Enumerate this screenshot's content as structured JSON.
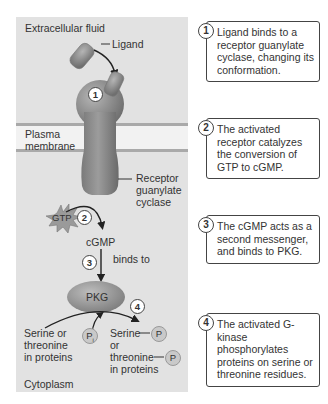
{
  "diagram": {
    "regions": {
      "extracellular": "Extracellular fluid",
      "membrane": "Plasma\nmembrane",
      "cytoplasm": "Cytoplasm"
    },
    "labels": {
      "ligand": "Ligand",
      "receptor": "Receptor\nguanylate\ncyclase",
      "gtp": "GTP",
      "cgmp": "cGMP",
      "binds_to": "binds to",
      "pkg": "PKG",
      "substrate": "Serine or\nthreonine\nin proteins",
      "pi": "P",
      "pi_sub": "i",
      "product_serine": "Serine",
      "product_or": "or",
      "product_threonine": "threonine",
      "product_in_proteins": "in proteins",
      "phosphate": "P"
    },
    "step_markers": [
      "1",
      "2",
      "3",
      "4"
    ]
  },
  "steps": [
    {
      "number": "1",
      "text": "Ligand binds to a receptor guanylate cyclase, changing its conformation."
    },
    {
      "number": "2",
      "text": "The activated receptor catalyzes the conversion of GTP to cGMP."
    },
    {
      "number": "3",
      "text": "The cGMP acts as a second messenger, and binds to PKG."
    },
    {
      "number": "4",
      "text": "The activated G-kinase phosphorylates proteins on serine or threonine residues."
    }
  ],
  "colors": {
    "panel_bg": "#e2e2e2",
    "membrane_bg": "#f2f2f2",
    "membrane_line": "#a9a9a9",
    "receptor": "#8a8a8a",
    "pkg": "#9a9a9a",
    "box_border": "#444444"
  }
}
